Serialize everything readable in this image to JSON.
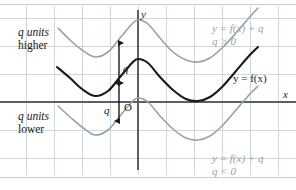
{
  "figure": {
    "axis_labels": {
      "x": "x",
      "y": "y",
      "origin": "O"
    },
    "annotations": {
      "higher_line1": "q units",
      "higher_line2": "higher",
      "lower_line1": "q units",
      "lower_line2": "lower",
      "arrow_upper": "q",
      "arrow_lower": "q"
    },
    "curve_labels": {
      "top_right_line1": "y = f(x) + q",
      "top_right_line2": "q > 0",
      "middle": "y = f(x)",
      "bottom_right_line1": "y = f(x) + q",
      "bottom_right_line2": "q < 0"
    },
    "colors": {
      "grid": "#cfd6dd",
      "axis": "#5a5f66",
      "curve_main": "#1a1a1a",
      "curve_translated": "#9aa0a8",
      "plate_rule": "#c9ccd1",
      "background": "#ffffff"
    }
  },
  "chart_data": {
    "type": "line",
    "xlabel": "x",
    "ylabel": "y",
    "grid": true,
    "legend": "inline-annotations",
    "origin_px": [
      138,
      102
    ],
    "grid_spacing_px": 28,
    "shift_px": 38,
    "series": [
      {
        "name": "y = f(x) + q, q > 0",
        "color": "#9aa0a8",
        "style": "solid",
        "points_px": [
          [
            58,
            28
          ],
          [
            70,
            40
          ],
          [
            82,
            50
          ],
          [
            95,
            57
          ],
          [
            108,
            52
          ],
          [
            120,
            38
          ],
          [
            132,
            24
          ],
          [
            138,
            20
          ],
          [
            148,
            24
          ],
          [
            160,
            38
          ],
          [
            173,
            52
          ],
          [
            186,
            60
          ],
          [
            198,
            62
          ],
          [
            210,
            58
          ],
          [
            222,
            48
          ],
          [
            236,
            33
          ],
          [
            248,
            19
          ],
          [
            258,
            8
          ]
        ]
      },
      {
        "name": "y = f(x)",
        "color": "#1a1a1a",
        "style": "solid",
        "points_px": [
          [
            57,
            67
          ],
          [
            70,
            78
          ],
          [
            82,
            89
          ],
          [
            95,
            96
          ],
          [
            108,
            91
          ],
          [
            120,
            77
          ],
          [
            132,
            63
          ],
          [
            138,
            59
          ],
          [
            148,
            63
          ],
          [
            160,
            77
          ],
          [
            173,
            90
          ],
          [
            186,
            99
          ],
          [
            198,
            101
          ],
          [
            210,
            97
          ],
          [
            222,
            87
          ],
          [
            236,
            71
          ],
          [
            248,
            57
          ],
          [
            258,
            47
          ]
        ]
      },
      {
        "name": "y = f(x) + q, q < 0",
        "color": "#9aa0a8",
        "style": "solid",
        "points_px": [
          [
            58,
            106
          ],
          [
            70,
            117
          ],
          [
            82,
            127
          ],
          [
            95,
            135
          ],
          [
            108,
            130
          ],
          [
            120,
            116
          ],
          [
            132,
            102
          ],
          [
            138,
            98
          ],
          [
            148,
            102
          ],
          [
            160,
            116
          ],
          [
            173,
            129
          ],
          [
            186,
            138
          ],
          [
            198,
            140
          ],
          [
            210,
            136
          ],
          [
            222,
            126
          ],
          [
            236,
            110
          ],
          [
            248,
            96
          ],
          [
            258,
            86
          ]
        ]
      }
    ],
    "arrows": [
      {
        "name": "q-upper",
        "x_px": 119,
        "y_top_px": 43,
        "y_bottom_px": 83,
        "label": "q"
      },
      {
        "name": "q-lower",
        "x_px": 119,
        "y_top_px": 83,
        "y_bottom_px": 121,
        "label": "q"
      }
    ]
  }
}
